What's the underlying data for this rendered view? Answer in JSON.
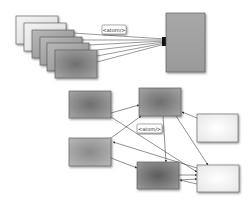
{
  "diagram": {
    "top": {
      "description": "Multiple feed documents aggregated into one",
      "source_pages": [
        {
          "id": "page-1",
          "shade": "light"
        },
        {
          "id": "page-2",
          "shade": "light"
        },
        {
          "id": "page-3",
          "shade": "medium"
        },
        {
          "id": "page-4",
          "shade": "medium"
        },
        {
          "id": "page-5",
          "shade": "medium"
        },
        {
          "id": "page-6",
          "shade": "dark"
        }
      ],
      "target": {
        "id": "aggregate",
        "shade": "medium"
      },
      "edge_label": "<atom/>"
    },
    "bottom": {
      "description": "Network of nodes exchanging feeds",
      "nodes": [
        {
          "id": "A",
          "shade": "dark"
        },
        {
          "id": "B",
          "shade": "dark"
        },
        {
          "id": "C",
          "shade": "light"
        },
        {
          "id": "D",
          "shade": "medium"
        },
        {
          "id": "E",
          "shade": "darkest"
        },
        {
          "id": "F",
          "shade": "light"
        }
      ],
      "edges": [
        {
          "from": "A",
          "to": "B"
        },
        {
          "from": "A",
          "to": "F"
        },
        {
          "from": "D",
          "to": "B"
        },
        {
          "from": "D",
          "to": "E"
        },
        {
          "from": "F",
          "to": "D"
        },
        {
          "from": "B",
          "to": "E"
        },
        {
          "from": "B",
          "to": "F"
        },
        {
          "from": "C",
          "to": "B"
        },
        {
          "from": "E",
          "to": "F"
        },
        {
          "from": "F",
          "to": "E"
        }
      ],
      "edge_label": "<atom/>"
    }
  },
  "colors": {
    "border": "#555555",
    "edge": "#444444",
    "light": "#f2f2f2",
    "medium": "#9a9a9a",
    "dark": "#7a7a7a",
    "darkest": "#666666"
  }
}
